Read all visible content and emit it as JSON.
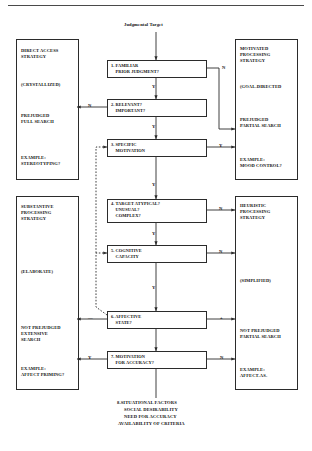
{
  "title": "Judgmental Target",
  "decision_boxes": [
    {
      "id": "q1",
      "lines": [
        "1. FAMILIAR",
        "    PRIOR JUDGMENT?"
      ]
    },
    {
      "id": "q2",
      "lines": [
        "2. RELEVANT?",
        "    IMPORTANT?"
      ]
    },
    {
      "id": "q3",
      "lines": [
        "3. SPECIFIC",
        "    MOTIVATION"
      ]
    },
    {
      "id": "q4",
      "lines": [
        "4. TARGET ATYPICAL?",
        "    UNUSUAL?",
        "    COMPLEX?"
      ]
    },
    {
      "id": "q5",
      "lines": [
        "5. COGNITIVE",
        "    CAPACITY"
      ]
    },
    {
      "id": "q6",
      "lines": [
        "6. AFFECTIVE",
        "    STATE?"
      ]
    },
    {
      "id": "q7",
      "lines": [
        "7. MOTIVATION",
        "    FOR ACCURACY?"
      ]
    }
  ],
  "left_panel_top": {
    "strategy": [
      "DIRECT ACCESS",
      "STRATEGY"
    ],
    "qualifier": "(CRYSTALLIZED)",
    "search": [
      "PREJUDGED",
      "FULL SEARCH"
    ],
    "example": [
      "EXAMPLE:",
      "STEREOTYPING?"
    ]
  },
  "left_panel_bottom": {
    "strategy": [
      "SUBSTANTIVE",
      "PROCESSING",
      "STRATEGY"
    ],
    "qualifier": "(ELABORATE)",
    "search": [
      "NOT PREJUDGED",
      "EXTENSIVE",
      "SEARCH"
    ],
    "example": [
      "EXAMPLE:",
      "AFFECT PRIMING?"
    ]
  },
  "right_panel_top": {
    "strategy": [
      "MOTIVATED",
      "PROCESSING",
      "STRATEGY"
    ],
    "qualifier": "(GOAL-DIRECTED",
    "search": [
      "PREJUDGED",
      "PARTIAL SEARCH"
    ],
    "example": [
      "EXAMPLE:",
      "MOOD CONTROL?"
    ]
  },
  "right_panel_bottom": {
    "strategy": [
      "HEURISTIC",
      "PROCESSING",
      "STRATEGY"
    ],
    "qualifier": "(SIMPLIFIED)",
    "search": [
      "NOT PREJUDGED",
      "PARTIAL SEARCH"
    ],
    "example": [
      "EXAMPLE:",
      "AFFECT-AS-",
      "INFORMATION"
    ]
  },
  "edge_labels": {
    "q1_no": "N",
    "q1_yes": "Y",
    "q2_no": "N",
    "q2_yes": "Y",
    "q3_yes": "Y",
    "q4_no": "N",
    "q4_yes": "Y",
    "q5_no": "N",
    "q5_yes": "Y",
    "q6_neg": "—",
    "q6_pos": "+",
    "q7_yes": "Y",
    "q7_no": "N"
  },
  "footer": [
    "8.SITUATIONAL FACTORS",
    "SOCIAL DESIRABILITY",
    "NEED FOR ACCURACY",
    "AVAILABILITY OF CRITERIA"
  ],
  "colors": {
    "line": "#2b2b2b",
    "text": "#111111",
    "rule": "#4a4a4a"
  }
}
